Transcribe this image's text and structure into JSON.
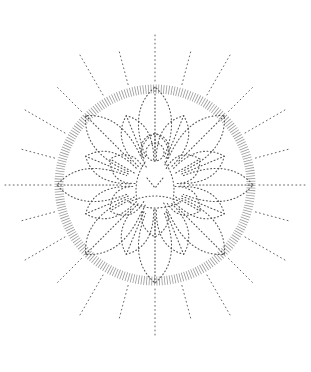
{
  "artwork": {
    "subject": "stippled lotus mandala with seated figure",
    "colors": {
      "background": "#ffffff",
      "ink": "#555555"
    },
    "center": {
      "x": 155,
      "y": 185
    },
    "ring_radius": 100,
    "ray_count": 24,
    "petal_layers": 3
  }
}
